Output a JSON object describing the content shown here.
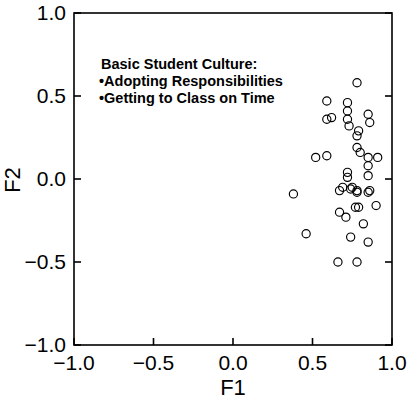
{
  "chart_data": {
    "type": "scatter",
    "title": "",
    "xlabel": "F1",
    "ylabel": "F2",
    "xlim": [
      -1.0,
      1.0
    ],
    "ylim": [
      -1.0,
      1.0
    ],
    "xticks": [
      -1.0,
      -0.5,
      0.0,
      0.5,
      1.0
    ],
    "yticks": [
      -1.0,
      -0.5,
      0.0,
      0.5,
      1.0
    ],
    "xticklabels": [
      "-1.0",
      "-0.5",
      "0.0",
      "0.5",
      "1.0"
    ],
    "yticklabels": [
      "-1.0",
      "-0.5",
      "0.0",
      "0.5",
      "1.0"
    ],
    "grid": false,
    "legend": "none",
    "marker": "open-circle",
    "marker_color": "#000000",
    "marker_fill": "none",
    "annotations": [
      {
        "name": "cluster-annotation",
        "lines": [
          "Basic  Student Culture:",
          "•Adopting Responsibilities",
          "•Getting to Class on Time"
        ],
        "x": -0.83,
        "y": 0.66
      }
    ],
    "series": [
      {
        "name": "students",
        "points": [
          [
            0.78,
            0.58
          ],
          [
            0.59,
            0.47
          ],
          [
            0.72,
            0.46
          ],
          [
            0.72,
            0.41
          ],
          [
            0.59,
            0.36
          ],
          [
            0.62,
            0.37
          ],
          [
            0.72,
            0.36
          ],
          [
            0.85,
            0.39
          ],
          [
            0.86,
            0.34
          ],
          [
            0.73,
            0.32
          ],
          [
            0.79,
            0.29
          ],
          [
            0.78,
            0.26
          ],
          [
            0.78,
            0.19
          ],
          [
            0.8,
            0.16
          ],
          [
            0.52,
            0.13
          ],
          [
            0.59,
            0.14
          ],
          [
            0.85,
            0.13
          ],
          [
            0.91,
            0.13
          ],
          [
            0.85,
            0.08
          ],
          [
            0.72,
            0.04
          ],
          [
            0.72,
            0.01
          ],
          [
            0.85,
            0.02
          ],
          [
            0.69,
            -0.05
          ],
          [
            0.75,
            -0.05
          ],
          [
            0.78,
            -0.07
          ],
          [
            0.86,
            -0.07
          ],
          [
            0.38,
            -0.09
          ],
          [
            0.67,
            -0.07
          ],
          [
            0.74,
            -0.06
          ],
          [
            0.78,
            -0.08
          ],
          [
            0.85,
            -0.08
          ],
          [
            0.9,
            -0.16
          ],
          [
            0.77,
            -0.17
          ],
          [
            0.79,
            -0.17
          ],
          [
            0.67,
            -0.2
          ],
          [
            0.71,
            -0.23
          ],
          [
            0.82,
            -0.27
          ],
          [
            0.46,
            -0.33
          ],
          [
            0.74,
            -0.35
          ],
          [
            0.85,
            -0.38
          ],
          [
            0.66,
            -0.5
          ],
          [
            0.78,
            -0.5
          ]
        ]
      }
    ]
  },
  "axes": {
    "x_axis_name": "F1",
    "y_axis_name": "F2"
  }
}
